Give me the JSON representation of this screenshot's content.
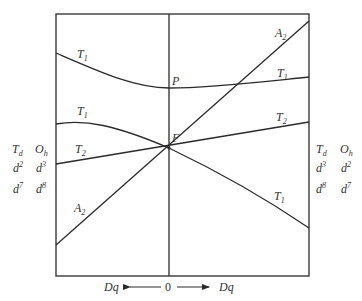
{
  "diagram": {
    "type": "Tanabe-Sugano / Orgel-style energy diagram",
    "curve_labels": {
      "upper_T1_left": {
        "base": "T",
        "sub": "1"
      },
      "upper_T1_right": {
        "base": "T",
        "sub": "1"
      },
      "mid_T1_left": {
        "base": "T",
        "sub": "1"
      },
      "lower_T1_right": {
        "base": "T",
        "sub": "1"
      },
      "T2_left": {
        "base": "T",
        "sub": "2"
      },
      "T2_right": {
        "base": "T",
        "sub": "2"
      },
      "A2_left": {
        "base": "A",
        "sub": "2"
      },
      "A2_right": {
        "base": "A",
        "sub": "2"
      }
    },
    "points": {
      "P": "P",
      "F": "F"
    },
    "left_side": {
      "header": [
        {
          "base": "T",
          "sub": "d"
        },
        {
          "base": "O",
          "sub": "h"
        }
      ],
      "row1": [
        {
          "base": "d",
          "sup": "2"
        },
        {
          "base": "d",
          "sup": "3"
        }
      ],
      "row2": [
        {
          "base": "d",
          "sup": "7"
        },
        {
          "base": "d",
          "sup": "8"
        }
      ]
    },
    "right_side": {
      "header": [
        {
          "base": "T",
          "sub": "d"
        },
        {
          "base": "O",
          "sub": "h"
        }
      ],
      "row1": [
        {
          "base": "d",
          "sup": "3"
        },
        {
          "base": "d",
          "sup": "2"
        }
      ],
      "row2": [
        {
          "base": "d",
          "sup": "8"
        },
        {
          "base": "d",
          "sup": "7"
        }
      ]
    },
    "x_axis": {
      "left_label": "Dq",
      "center_label": "0",
      "right_label": "Dq"
    }
  }
}
